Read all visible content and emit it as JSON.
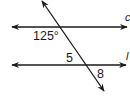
{
  "diagram": {
    "type": "parallel-lines-transversal",
    "lines": [
      {
        "name": "c",
        "label": "c",
        "role": "parallel-line"
      },
      {
        "name": "l",
        "label": "l",
        "role": "parallel-line"
      },
      {
        "name": "transversal",
        "label": "",
        "role": "transversal"
      }
    ],
    "angles": {
      "given": {
        "label": "125°",
        "value": 125,
        "unit": "degrees"
      },
      "angle5": {
        "label": "5"
      },
      "angle8": {
        "label": "8"
      }
    },
    "colors": {
      "stroke": "#1a1a1a",
      "background": "#ffffff"
    }
  }
}
